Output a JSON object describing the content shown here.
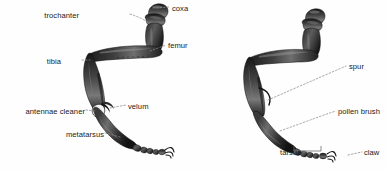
{
  "figure": {
    "type": "anatomical-illustration",
    "background_color": "#fefefe",
    "label_color": "#1a1a1a",
    "leader_color": "#8a8a8a",
    "leg_dark": "#262626",
    "leg_mid": "#4a4a4a",
    "leg_light": "#9a9a9a"
  },
  "left_leg": {
    "name": "left-leg-figure",
    "labels": [
      {
        "key": "trochanter",
        "text": "trochanter",
        "x": 79,
        "y": 11,
        "align": "right"
      },
      {
        "key": "coxa",
        "text": "coxa",
        "x": 172,
        "y": 4,
        "align": "left"
      },
      {
        "key": "femur",
        "text": "femur",
        "x": 168,
        "y": 41,
        "align": "left"
      },
      {
        "key": "tibia",
        "text": "tibia",
        "x": 61,
        "y": 57,
        "align": "right"
      },
      {
        "key": "velum",
        "text": "velum",
        "x": 128,
        "y": 102,
        "align": "left"
      },
      {
        "key": "antennae_cleaner",
        "text": "antennae cleaner",
        "x": 17,
        "y": 107,
        "align": "right"
      },
      {
        "key": "metatarsus",
        "text": "metatarsus",
        "x": 52,
        "y": 130,
        "align": "right"
      }
    ]
  },
  "right_leg": {
    "name": "right-leg-figure",
    "labels": [
      {
        "key": "spur",
        "text": "spur",
        "x": 349,
        "y": 62,
        "align": "left"
      },
      {
        "key": "pollen_brush",
        "text": "pollen brush",
        "x": 338,
        "y": 107,
        "align": "left"
      },
      {
        "key": "tarsus",
        "text": "tarsus",
        "x": 272,
        "y": 148,
        "align": "right"
      },
      {
        "key": "claw",
        "text": "claw",
        "x": 364,
        "y": 148,
        "align": "left"
      }
    ]
  }
}
